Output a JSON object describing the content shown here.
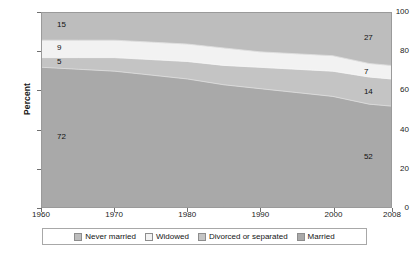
{
  "chart_data": {
    "type": "area",
    "title": "",
    "subtitle": "",
    "xlabel": "",
    "ylabel": "Percent",
    "xlim": [
      1960,
      2008
    ],
    "ylim": [
      0,
      100
    ],
    "grid": false,
    "stacked": true,
    "legend_position": "bottom",
    "x_tick_labels": [
      "1960",
      "1970",
      "1980",
      "1990",
      "2000",
      "2008"
    ],
    "x_ticks": [
      1960,
      1970,
      1980,
      1990,
      2000,
      2008
    ],
    "y_tick_labels": [
      "0",
      "20",
      "40",
      "60",
      "80",
      "100"
    ],
    "y_ticks": [
      0,
      20,
      40,
      60,
      80,
      100
    ],
    "x": [
      1960,
      1965,
      1970,
      1975,
      1980,
      1985,
      1990,
      1995,
      2000,
      2005,
      2008
    ],
    "series": [
      {
        "name": "Married",
        "color": "#a9a9a9",
        "values": [
          72,
          71,
          70,
          68,
          66,
          63,
          61,
          59,
          57,
          53,
          52
        ],
        "start_label": "72",
        "end_label": "52"
      },
      {
        "name": "Divorced or separated",
        "color": "#c4c4c4",
        "values": [
          5,
          6,
          7,
          8,
          9,
          10,
          11,
          12,
          13,
          14,
          14
        ],
        "start_label": "5",
        "end_label": "14"
      },
      {
        "name": "Widowed",
        "color": "#f2f2f2",
        "values": [
          9,
          9,
          9,
          9,
          9,
          9,
          8,
          8,
          8,
          7,
          7
        ],
        "start_label": "9",
        "end_label": "7"
      },
      {
        "name": "Never married",
        "color": "#bdbdbd",
        "values": [
          15,
          15,
          15,
          16,
          17,
          19,
          21,
          23,
          24,
          26,
          27
        ],
        "start_label": "15",
        "end_label": "27"
      }
    ],
    "legend": [
      {
        "label": "Never married",
        "color": "#bdbdbd"
      },
      {
        "label": "Widowed",
        "color": "#f2f2f2"
      },
      {
        "label": "Divorced or separated",
        "color": "#c4c4c4"
      },
      {
        "label": "Married",
        "color": "#a9a9a9"
      }
    ],
    "annotations": {
      "left": [
        {
          "text": "15",
          "series": "Never married"
        },
        {
          "text": "9",
          "series": "Widowed"
        },
        {
          "text": "5",
          "series": "Divorced or separated"
        },
        {
          "text": "72",
          "series": "Married"
        }
      ],
      "right": [
        {
          "text": "27",
          "series": "Never married"
        },
        {
          "text": "7",
          "series": "Widowed"
        },
        {
          "text": "14",
          "series": "Divorced or separated"
        },
        {
          "text": "52",
          "series": "Married"
        }
      ]
    }
  }
}
